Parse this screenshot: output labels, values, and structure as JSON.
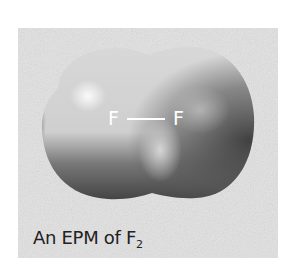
{
  "figure": {
    "title": "An EPM of F2",
    "caption_prefix": "An EPM of F",
    "caption_subscript": "2",
    "bond_label": {
      "left_atom": "F",
      "right_atom": "F"
    },
    "colors": {
      "box_background": "#e2e2e2",
      "surface_light": "#d4d4d4",
      "surface_highlight": "#f2f2f2",
      "surface_dark": "#4a4a4a",
      "label_text": "#ffffff",
      "caption_text": "#222222"
    }
  }
}
